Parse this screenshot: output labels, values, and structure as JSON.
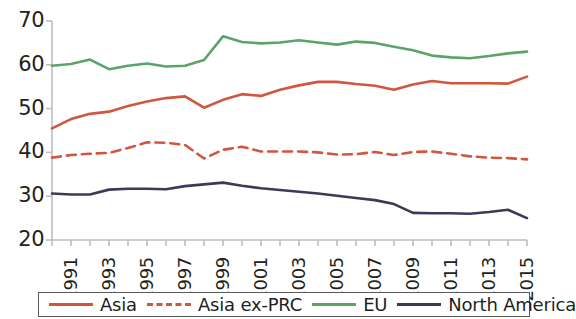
{
  "chart_data": {
    "type": "line",
    "title": "",
    "subtitle": "",
    "xlabel": "",
    "ylabel": "",
    "xlim": [
      1990,
      2015
    ],
    "ylim": [
      20,
      70
    ],
    "grid": false,
    "legend_position": "bottom",
    "x": [
      1990,
      1991,
      1992,
      1993,
      1994,
      1995,
      1996,
      1997,
      1998,
      1999,
      2000,
      2001,
      2002,
      2003,
      2004,
      2005,
      2006,
      2007,
      2008,
      2009,
      2010,
      2011,
      2012,
      2013,
      2014,
      2015
    ],
    "y_ticks": [
      20,
      30,
      40,
      50,
      60,
      70
    ],
    "x_tick_labels": [
      "1991",
      "1993",
      "1995",
      "1997",
      "1999",
      "2001",
      "2003",
      "2005",
      "2007",
      "2009",
      "2011",
      "2013",
      "2015"
    ],
    "x_tick_values": [
      1991,
      1993,
      1995,
      1997,
      1999,
      2001,
      2003,
      2005,
      2007,
      2009,
      2011,
      2013,
      2015
    ],
    "series": [
      {
        "name": "Asia",
        "color": "#d0573d",
        "style": "solid",
        "values": [
          45.5,
          47.6,
          48.8,
          49.3,
          50.6,
          51.6,
          52.4,
          52.8,
          50.2,
          52.0,
          53.3,
          52.9,
          54.3,
          55.3,
          56.1,
          56.1,
          55.6,
          55.2,
          54.3,
          55.5,
          56.3,
          55.8,
          55.8,
          55.8,
          55.7,
          57.3
        ]
      },
      {
        "name": "Asia ex-PRC",
        "color": "#d0573d",
        "style": "dashed",
        "values": [
          38.8,
          39.4,
          39.7,
          39.9,
          41.0,
          42.3,
          42.2,
          41.7,
          38.6,
          40.6,
          41.3,
          40.2,
          40.2,
          40.2,
          40.0,
          39.5,
          39.6,
          40.1,
          39.4,
          40.1,
          40.2,
          39.7,
          39.1,
          38.8,
          38.7,
          38.4
        ]
      },
      {
        "name": "EU",
        "color": "#5aa469",
        "style": "solid",
        "values": [
          59.8,
          60.2,
          61.2,
          59.0,
          59.8,
          60.3,
          59.6,
          59.8,
          61.1,
          66.5,
          65.2,
          64.9,
          65.1,
          65.6,
          65.1,
          64.6,
          65.3,
          65.0,
          64.1,
          63.3,
          62.1,
          61.7,
          61.5,
          62.0,
          62.6,
          63.0
        ]
      },
      {
        "name": "North America",
        "color": "#3b3a57",
        "style": "solid",
        "values": [
          30.6,
          30.4,
          30.4,
          31.5,
          31.7,
          31.7,
          31.6,
          32.3,
          32.7,
          33.1,
          32.4,
          31.8,
          31.4,
          31.0,
          30.6,
          30.1,
          29.6,
          29.1,
          28.2,
          26.2,
          26.1,
          26.1,
          26.0,
          26.4,
          26.9,
          25.0
        ]
      }
    ]
  },
  "legend": {
    "items": [
      {
        "label": "Asia",
        "color": "#d0573d",
        "style": "solid"
      },
      {
        "label": "Asia ex-PRC",
        "color": "#d0573d",
        "style": "dashed"
      },
      {
        "label": "EU",
        "color": "#5aa469",
        "style": "solid"
      },
      {
        "label": "North America",
        "color": "#3b3a57",
        "style": "solid"
      }
    ]
  },
  "axis": {
    "line_color": "#bcbec0"
  }
}
